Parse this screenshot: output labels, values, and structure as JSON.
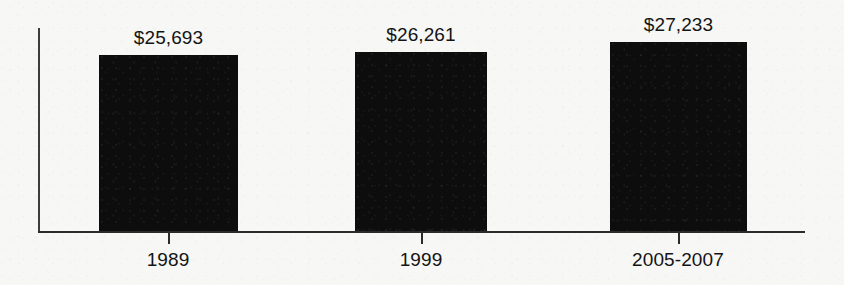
{
  "chart_data": {
    "type": "bar",
    "title": "",
    "subtitle": "",
    "xlabel": "",
    "ylabel": "",
    "categories": [
      "1989",
      "1999",
      "2005-2007"
    ],
    "values": [
      25693,
      26261,
      27233
    ],
    "value_labels": [
      "$25,693",
      "$26,261",
      "$27,233"
    ],
    "series": [
      {
        "name": "",
        "values": [
          25693,
          26261,
          27233
        ]
      }
    ],
    "grid": false,
    "legend": null,
    "legend_position": "none",
    "ylim": [
      24000,
      28000
    ],
    "axis_color": "#2b2b2b",
    "bar_color": "#0d0d0d",
    "background_color": "#f7f7f5",
    "label_color": "#141414",
    "annotations": []
  },
  "bars": [
    {
      "category": "1989",
      "value_label": "$25,693",
      "left": 99,
      "width": 139,
      "top": 55,
      "tick_x": 168
    },
    {
      "category": "1999",
      "value_label": "$26,261",
      "left": 355,
      "width": 132,
      "top": 52,
      "tick_x": 421
    },
    {
      "category": "2005-2007",
      "value_label": "$27,233",
      "left": 610,
      "width": 137,
      "top": 42,
      "tick_x": 678
    }
  ]
}
